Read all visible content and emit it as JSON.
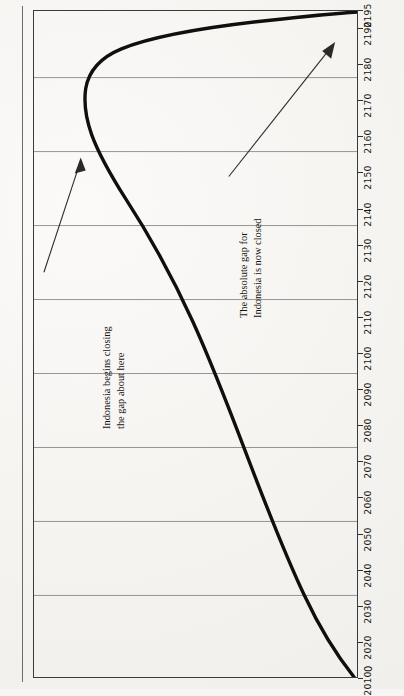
{
  "figure": {
    "number": "Figure 2.2"
  },
  "axes": {
    "y_origin_label": "0",
    "x_tick_labels": [
      "2010",
      "2020",
      "2030",
      "2040",
      "2050",
      "2060",
      "2070",
      "2080",
      "2090",
      "2100",
      "2110",
      "2120",
      "2130",
      "2140",
      "2150",
      "2160",
      "2170",
      "2180",
      "2190",
      "2195"
    ]
  },
  "annotations": {
    "a1_line1": "Indonesia begins closing",
    "a1_line2": "the gap about here",
    "a2_line1": "The absolute gap for",
    "a2_line2": "Indonesia is now closed"
  },
  "chart_data": {
    "type": "line",
    "xlabel": "",
    "ylabel": "0",
    "xlim": [
      2010,
      2195
    ],
    "ylim": [
      0,
      100
    ],
    "grid": true,
    "legend": "none",
    "x_tick_labels": [
      "2010",
      "2020",
      "2030",
      "2040",
      "2050",
      "2060",
      "2070",
      "2080",
      "2090",
      "2100",
      "2110",
      "2120",
      "2130",
      "2140",
      "2150",
      "2160",
      "2170",
      "2180",
      "2190",
      "2195"
    ],
    "gridlines_vertical": 8,
    "series": [
      {
        "name": "Absolute gap",
        "x": [
          2010,
          2020,
          2030,
          2040,
          2050,
          2060,
          2070,
          2080,
          2090,
          2100,
          2110,
          2120,
          2130,
          2140,
          2150,
          2155,
          2160,
          2165,
          2170,
          2175,
          2180,
          2185,
          2190,
          2195
        ],
        "values": [
          0,
          9,
          18,
          27,
          35,
          43,
          50,
          57,
          63,
          69,
          75,
          80,
          85,
          89,
          92,
          93,
          93,
          92,
          89,
          83,
          72,
          56,
          33,
          0
        ]
      }
    ],
    "annotations": [
      {
        "text": "Indonesia begins closing the gap about here",
        "points_to_x": 2158,
        "points_to_y": 93
      },
      {
        "text": "The absolute gap for Indonesia is now closed",
        "points_to_x": 2193,
        "points_to_y": 6
      }
    ]
  }
}
